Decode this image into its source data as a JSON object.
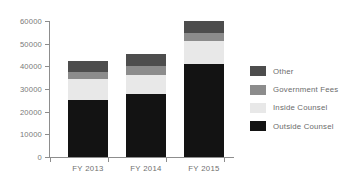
{
  "chart_data": {
    "type": "bar",
    "stacked": true,
    "title": "",
    "subtitle": "",
    "xlabel": "",
    "ylabel": "",
    "categories": [
      "FY 2013",
      "FY 2014",
      "FY 2015"
    ],
    "ylim": [
      0,
      60000
    ],
    "ytick_labels": [
      "60000",
      "50000",
      "40000",
      "30000",
      "20000",
      "10000",
      "0"
    ],
    "ytick_values": [
      60000,
      50000,
      40000,
      30000,
      20000,
      10000,
      0
    ],
    "grid": false,
    "legend_position": "right",
    "series": [
      {
        "name": "Other",
        "color": "#4d4d4d",
        "values": [
          4900,
          5300,
          5300
        ]
      },
      {
        "name": "Government Fees",
        "color": "#8c8c8c",
        "values": [
          3100,
          4000,
          3500
        ]
      },
      {
        "name": "Inside Counsel",
        "color": "#e8e8e8",
        "values": [
          9300,
          8400,
          10100
        ]
      },
      {
        "name": "Outside Counsel",
        "color": "#131313",
        "values": [
          25200,
          27800,
          41000
        ]
      }
    ],
    "totals": [
      42500,
      45500,
      59900
    ]
  },
  "axis": {
    "ticks": [
      {
        "label": "60000",
        "value": 60000
      },
      {
        "label": "50000",
        "value": 50000
      },
      {
        "label": "40000",
        "value": 40000
      },
      {
        "label": "30000",
        "value": 30000
      },
      {
        "label": "20000",
        "value": 20000
      },
      {
        "label": "10000",
        "value": 10000
      },
      {
        "label": "0",
        "value": 0
      }
    ],
    "categories": [
      {
        "label": "FY 2013"
      },
      {
        "label": "FY 2014"
      },
      {
        "label": "FY 2015"
      }
    ]
  },
  "legend": {
    "items": [
      {
        "label": "Other",
        "color": "#4d4d4d"
      },
      {
        "label": "Government Fees",
        "color": "#8c8c8c"
      },
      {
        "label": "Inside Counsel",
        "color": "#e8e8e8"
      },
      {
        "label": "Outside Counsel",
        "color": "#131313"
      }
    ]
  }
}
